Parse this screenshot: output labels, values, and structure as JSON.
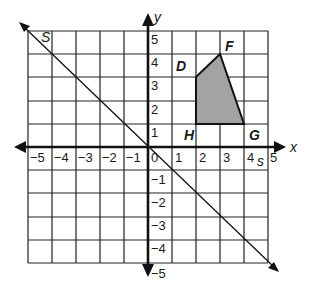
{
  "figure": {
    "type": "coordinate-grid",
    "x_axis": {
      "label": "x",
      "min": -5,
      "max": 5,
      "ticks": [
        "-5",
        "-4",
        "-3",
        "-2",
        "-1",
        "0",
        "1",
        "2",
        "3",
        "4",
        "5"
      ]
    },
    "y_axis": {
      "label": "y",
      "min": -5,
      "max": 5,
      "ticks": [
        "-5",
        "-4",
        "-3",
        "-2",
        "-1",
        "1",
        "2",
        "3",
        "4",
        "5"
      ]
    },
    "line": {
      "name": "s",
      "equation": "y = -x",
      "label_top": "s",
      "label_bottom": "s"
    },
    "polygon": {
      "name": "DFGH",
      "fill": "#a0a0a0",
      "vertices": [
        {
          "label": "D",
          "x": 2,
          "y": 3
        },
        {
          "label": "F",
          "x": 3,
          "y": 4
        },
        {
          "label": "G",
          "x": 4,
          "y": 1
        },
        {
          "label": "H",
          "x": 2,
          "y": 1
        }
      ]
    }
  },
  "labels": {
    "x": "x",
    "y": "y",
    "s_top": "S",
    "s_bottom": "s",
    "D": "D",
    "F": "F",
    "G": "G",
    "H": "H",
    "xt": {
      "m5": "−5",
      "m4": "−4",
      "m3": "−3",
      "m2": "−2",
      "m1": "−1",
      "z": "0",
      "p1": "1",
      "p2": "2",
      "p3": "3",
      "p4": "4",
      "p5": "5"
    },
    "yt": {
      "p5": "5",
      "p4": "4",
      "p3": "3",
      "p2": "2",
      "p1": "1",
      "m1": "−1",
      "m2": "−2",
      "m3": "−3",
      "m4": "−4",
      "m5": "−5"
    }
  }
}
